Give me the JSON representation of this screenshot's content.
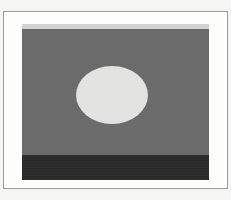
{
  "document": {
    "title": "Framed Landscape Image",
    "kind": "photograph"
  },
  "frame": {
    "border_color": "#9a9a9a",
    "mat_color": "#fdfdfc",
    "page_background": "#f5f5f3",
    "border_width_px": 1
  },
  "picture": {
    "label": "picture-plate",
    "background_color": "#6b6b6b",
    "width_px": 187,
    "height_px": 156
  },
  "regions": [
    {
      "name": "top-light-band",
      "label": "Top light band",
      "color": "#d2d2d2",
      "top_px": 0,
      "height_px": 5
    },
    {
      "name": "mid-gray-field",
      "label": "Mid gray field",
      "color": "#6b6b6b",
      "top_px": 5,
      "height_px": 126
    },
    {
      "name": "bottom-dark-band",
      "label": "Bottom dark band",
      "color": "#2b2b2b",
      "top_px": 131,
      "height_px": 25
    }
  ],
  "shapes": [
    {
      "name": "light-ellipse",
      "label": "Light ellipse",
      "color": "#e4e4e2",
      "center_x_px": 90,
      "center_y_px": 71,
      "radius_x_px": 36,
      "radius_y_px": 29
    }
  ],
  "caption": {
    "text": ""
  }
}
